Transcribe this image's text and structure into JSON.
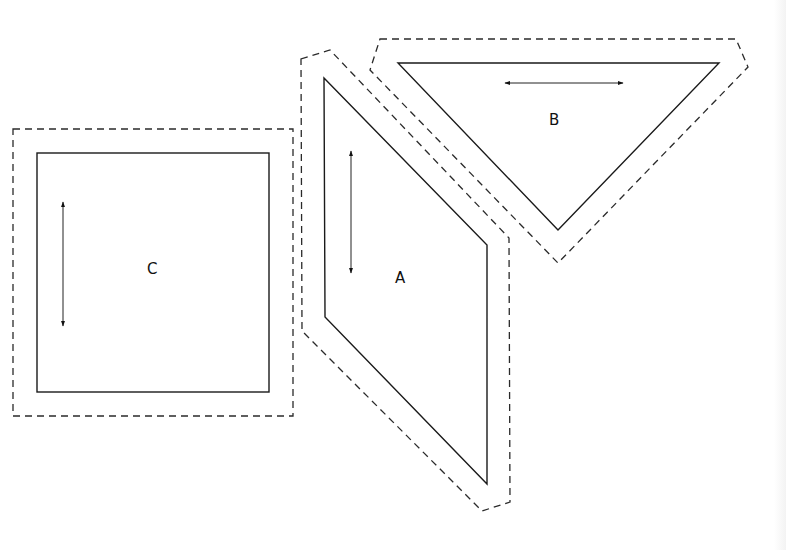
{
  "diagram": {
    "type": "sewing-pattern-pieces",
    "colors": {
      "background": "#ffffff",
      "outline": "#1a1a1a",
      "cutting_line": "#2a2a2a"
    },
    "pieces": [
      {
        "id": "C",
        "label": "C",
        "shape": "square",
        "grainline": "vertical"
      },
      {
        "id": "A",
        "label": "A",
        "shape": "parallelogram",
        "grainline": "vertical"
      },
      {
        "id": "B",
        "label": "B",
        "shape": "triangle",
        "grainline": "horizontal"
      }
    ],
    "legend": {
      "solid_line": "seam line",
      "dashed_line": "cutting line",
      "double_arrow": "grainline"
    }
  }
}
